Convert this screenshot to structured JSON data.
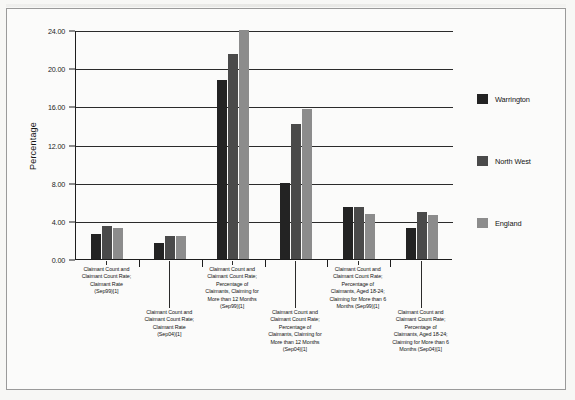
{
  "chart_data": {
    "type": "bar",
    "title": "",
    "xlabel": "",
    "ylabel": "Percentage",
    "ylim": [
      0,
      24
    ],
    "ytick_step": 4,
    "ytick_labels": [
      "0.00",
      "4.00",
      "8.00",
      "12.00",
      "16.00",
      "20.00",
      "24.00"
    ],
    "ytick_values": [
      0,
      4,
      8,
      12,
      16,
      20,
      24
    ],
    "grid": true,
    "legend_position": "right",
    "categories": [
      "Claimant Count and\nClaimant Count Rate;\nClaimant Rate\n(Sep99)[1]",
      "Claimant Count and\nClaimant Count Rate;\nClaimant Rate\n(Sep04)[1]",
      "Claimant Count and\nClaimant Count Rate;\nPercentage of\nClaimants, Claiming for\nMore than 12 Months\n(Sep99)[1]",
      "Claimant Count and\nClaimant Count Rate;\nPercentage of\nClaimants, Claiming for\nMore than 12 Months\n(Sep04)[1]",
      "Claimant Count and\nClaimant Count Rate;\nPercentage of\nClaimants, Aged 18-24;\nClaiming for More than 6\nMonths (Sep99)[1]",
      "Claimant Count and\nClaimant Count Rate;\nPercentage of\nClaimants, Aged 18-24;\nClaiming for More than 6\nMonths (Sep04)[1]"
    ],
    "series": [
      {
        "name": "Warrington",
        "color": "#232323",
        "values": [
          2.6,
          1.7,
          18.8,
          8.0,
          5.5,
          3.2
        ]
      },
      {
        "name": "North West",
        "color": "#4a4a4a",
        "values": [
          3.5,
          2.4,
          21.5,
          14.1,
          5.5,
          4.9
        ]
      },
      {
        "name": "England",
        "color": "#8c8c8c",
        "values": [
          3.3,
          2.4,
          24.0,
          15.7,
          4.7,
          4.6
        ]
      }
    ]
  },
  "legend": {
    "items": [
      {
        "label": "Warrington",
        "color": "#232323"
      },
      {
        "label": "North West",
        "color": "#4a4a4a"
      },
      {
        "label": "England",
        "color": "#8c8c8c"
      }
    ]
  }
}
